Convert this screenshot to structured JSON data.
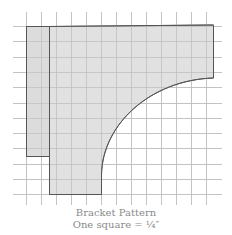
{
  "diagram": {
    "title": "Bracket Pattern",
    "scale_label": "One square = ¼″",
    "grid": {
      "cell_size_px": 15,
      "x_lines": [
        26,
        41,
        56,
        71,
        86,
        101,
        116,
        131,
        146,
        161,
        176,
        191,
        206
      ],
      "y_lines": [
        26,
        41,
        57,
        72,
        87,
        103,
        118,
        133,
        148,
        164,
        179,
        194
      ],
      "x_extent": [
        13,
        222
      ],
      "y_extent": [
        12,
        205
      ],
      "line_color": "#d2d2d2"
    },
    "shapes": [
      {
        "name": "back-strip",
        "x": 26,
        "y": 26,
        "width": 23,
        "height": 130
      },
      {
        "name": "bracket-body",
        "description": "bracket with quarter-curve cutout"
      }
    ],
    "fill_color": "#dcdcdc",
    "stroke_color": "#555555",
    "caption_color": "#8a8a8a"
  }
}
